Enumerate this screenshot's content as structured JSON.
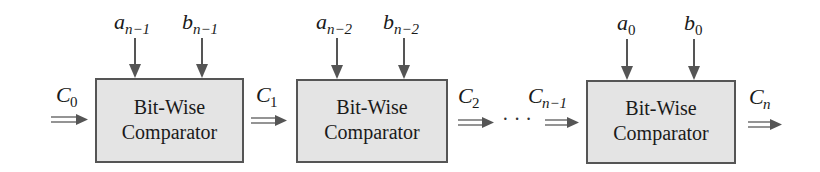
{
  "diagram": {
    "type": "cascaded bit-wise comparator chain",
    "stages": [
      {
        "label_line1": "Bit-Wise",
        "label_line2": "Comparator",
        "input_a": {
          "base": "a",
          "sub": "n−1"
        },
        "input_b": {
          "base": "b",
          "sub": "n−1"
        }
      },
      {
        "label_line1": "Bit-Wise",
        "label_line2": "Comparator",
        "input_a": {
          "base": "a",
          "sub": "n−2"
        },
        "input_b": {
          "base": "b",
          "sub": "n−2"
        }
      },
      {
        "label_line1": "Bit-Wise",
        "label_line2": "Comparator",
        "input_a": {
          "base": "a",
          "sub": "0"
        },
        "input_b": {
          "base": "b",
          "sub": "0"
        }
      }
    ],
    "carries": [
      {
        "base": "C",
        "sub": "0"
      },
      {
        "base": "C",
        "sub": "1"
      },
      {
        "base": "C",
        "sub": "2"
      },
      {
        "base": "C",
        "sub": "n−1"
      },
      {
        "base": "C",
        "sub": "n"
      }
    ],
    "ellipsis": "· · ·"
  }
}
